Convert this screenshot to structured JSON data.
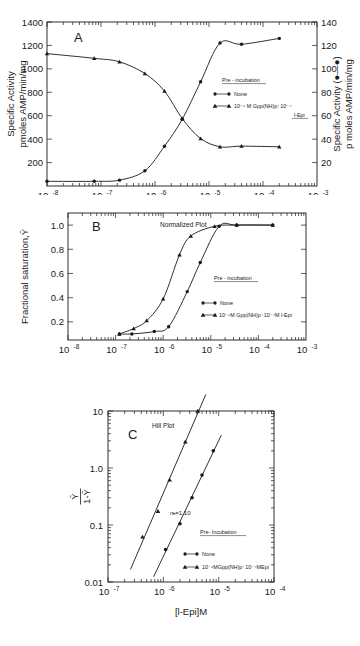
{
  "figure": {
    "xlabel_bottom": "[l-Epi]M"
  },
  "chart_data": [
    {
      "type": "line",
      "panel": "A",
      "title": "",
      "xlabel": "",
      "ylabel": "Specific Activity\npmoles AMP/min/mg",
      "ylabel_right": "Specific Activity (●—●)\np moles AMP/min/mg",
      "xscale": "log",
      "xlim": [
        1e-08,
        0.001
      ],
      "xticklabels": [
        "10",
        "10",
        "10",
        "10",
        "10",
        "10"
      ],
      "xtickexp": [
        "-8",
        "-7",
        "-6",
        "-5",
        "-4",
        "-3"
      ],
      "ylim": [
        0,
        1400
      ],
      "yticklabels": [
        "200",
        "400",
        "600",
        "800",
        "1000",
        "1200",
        "1400"
      ],
      "yticks": [
        200,
        400,
        600,
        800,
        1000,
        1200,
        1400
      ],
      "ylim_right": [
        0,
        140
      ],
      "yticklabels_right": [
        "20",
        "40",
        "60",
        "80",
        "100",
        "120",
        "140"
      ],
      "yticks_right": [
        20,
        40,
        60,
        80,
        100,
        120,
        140
      ],
      "grid": false,
      "legend": {
        "header": "Pre - incubation",
        "entries": [
          {
            "marker": "circle",
            "label": "None"
          },
          {
            "marker": "triangle",
            "label": "10⁻⁶ M Gpp(NH)p⁺10⁻⁴",
            "label2": "l-Epi"
          }
        ]
      },
      "series": [
        {
          "name": "None",
          "marker": "circle",
          "axis": "right",
          "points": [
            {
              "x": 1e-08,
              "y": 4
            },
            {
              "x": 7.5e-08,
              "y": 4
            },
            {
              "x": 2.2e-07,
              "y": 5
            },
            {
              "x": 6.5e-07,
              "y": 13
            },
            {
              "x": 1.5e-06,
              "y": 34
            },
            {
              "x": 3.2e-06,
              "y": 57
            },
            {
              "x": 7e-06,
              "y": 89
            },
            {
              "x": 1.6e-05,
              "y": 122
            },
            {
              "x": 4e-05,
              "y": 121
            },
            {
              "x": 0.0002,
              "y": 126
            }
          ]
        },
        {
          "name": "10⁻⁶ M Gpp(NH)p + 10⁻⁴ l-Epi",
          "marker": "triangle",
          "axis": "left",
          "points": [
            {
              "x": 1e-08,
              "y": 1130
            },
            {
              "x": 7.5e-08,
              "y": 1090
            },
            {
              "x": 2.2e-07,
              "y": 1060
            },
            {
              "x": 6.5e-07,
              "y": 960
            },
            {
              "x": 1.5e-06,
              "y": 810
            },
            {
              "x": 3.2e-06,
              "y": 575
            },
            {
              "x": 7e-06,
              "y": 405
            },
            {
              "x": 1.6e-05,
              "y": 335
            },
            {
              "x": 4e-05,
              "y": 340
            },
            {
              "x": 0.0002,
              "y": 335
            }
          ]
        }
      ]
    },
    {
      "type": "line",
      "panel": "B",
      "title": "Normalized Plot",
      "xlabel": "",
      "ylabel": "Fractional saturation,Ȳ",
      "xscale": "log",
      "xlim": [
        1e-08,
        0.001
      ],
      "xticklabels": [
        "10",
        "10",
        "10",
        "10",
        "10",
        "10"
      ],
      "xtickexp": [
        "-8",
        "-7",
        "-6",
        "-5",
        "-4",
        "-3"
      ],
      "ylim": [
        0.05,
        1.1
      ],
      "yticklabels": [
        "0.2",
        "0.4",
        "0.6",
        "0.8",
        "1.0"
      ],
      "yticks": [
        0.2,
        0.4,
        0.6,
        0.8,
        1.0
      ],
      "grid": false,
      "legend": {
        "header": "Pre - incubation",
        "entries": [
          {
            "marker": "circle",
            "label": "None"
          },
          {
            "marker": "triangle",
            "label": "10⁻⁶M Gpp(NH)p⁺10⁻⁴M l-Epi"
          }
        ]
      },
      "series": [
        {
          "name": "None",
          "marker": "circle",
          "points": [
            {
              "x": 1.2e-07,
              "y": 0.1
            },
            {
              "x": 2.2e-07,
              "y": 0.1
            },
            {
              "x": 6.5e-07,
              "y": 0.12
            },
            {
              "x": 1.3e-06,
              "y": 0.16
            },
            {
              "x": 3.2e-06,
              "y": 0.45
            },
            {
              "x": 6e-06,
              "y": 0.69
            },
            {
              "x": 1.5e-05,
              "y": 0.99
            },
            {
              "x": 3.5e-05,
              "y": 1.0
            },
            {
              "x": 0.0002,
              "y": 1.0
            }
          ]
        },
        {
          "name": "10⁻⁶M Gpp(NH)p + 10⁻⁴M l-Epi",
          "marker": "triangle",
          "points": [
            {
              "x": 1.2e-07,
              "y": 0.1
            },
            {
              "x": 2.4e-07,
              "y": 0.145
            },
            {
              "x": 4.5e-07,
              "y": 0.21
            },
            {
              "x": 1e-06,
              "y": 0.39
            },
            {
              "x": 2.2e-06,
              "y": 0.755
            },
            {
              "x": 3.8e-06,
              "y": 0.91
            },
            {
              "x": 1.2e-05,
              "y": 0.99
            },
            {
              "x": 3.5e-05,
              "y": 1.0
            },
            {
              "x": 0.0002,
              "y": 1.0
            }
          ]
        }
      ]
    },
    {
      "type": "scatter",
      "panel": "C",
      "title": "Hill Plot",
      "xlabel": "[l-Epi]M",
      "ylabel": "Ȳ / 1-Ȳ",
      "xscale": "log",
      "yscale": "log",
      "xlim": [
        1e-07,
        0.0001
      ],
      "xticklabels": [
        "10",
        "10",
        "10",
        "10"
      ],
      "xtickexp": [
        "-7",
        "-6",
        "-5",
        "-4"
      ],
      "ylim": [
        0.01,
        10
      ],
      "yticklabels": [
        "0.01",
        "0.1",
        "1.0",
        "10"
      ],
      "yticks": [
        0.01,
        0.1,
        1.0,
        10
      ],
      "grid": false,
      "annotation": "nₕ=1.10",
      "legend": {
        "header": "Pre- Incubation",
        "entries": [
          {
            "marker": "circle",
            "label": "None"
          },
          {
            "marker": "triangle",
            "label": "10⁻⁶MGpp(NH)p⁺10⁻⁴MEpi"
          }
        ]
      },
      "series": [
        {
          "name": "None",
          "marker": "circle",
          "points": [
            {
              "x": 1.1e-06,
              "y": 0.037
            },
            {
              "x": 2e-06,
              "y": 0.105
            },
            {
              "x": 3.3e-06,
              "y": 0.3
            },
            {
              "x": 5e-06,
              "y": 0.75
            },
            {
              "x": 8e-06,
              "y": 2.0
            }
          ]
        },
        {
          "name": "10⁻⁶MGpp(NH)p + 10⁻⁴MEpi",
          "marker": "triangle",
          "points": [
            {
              "x": 4.2e-07,
              "y": 0.062
            },
            {
              "x": 8e-07,
              "y": 0.175
            },
            {
              "x": 1.3e-06,
              "y": 0.62
            },
            {
              "x": 2.5e-06,
              "y": 2.9
            },
            {
              "x": 4.2e-06,
              "y": 10.0
            }
          ]
        }
      ]
    }
  ]
}
